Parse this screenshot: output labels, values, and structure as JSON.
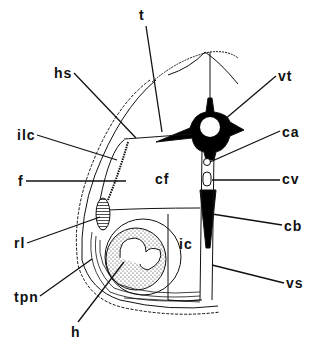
{
  "figure": {
    "type": "anatomical cross-section diagram",
    "labels": [
      {
        "id": "t",
        "text": "t",
        "x": 139,
        "y": 6
      },
      {
        "id": "hs",
        "text": "hs",
        "x": 54,
        "y": 67
      },
      {
        "id": "vt",
        "text": "vt",
        "x": 278,
        "y": 70
      },
      {
        "id": "ilc",
        "text": "ilc",
        "x": 18,
        "y": 129
      },
      {
        "id": "ca",
        "text": "ca",
        "x": 282,
        "y": 126
      },
      {
        "id": "f",
        "text": "f",
        "x": 18,
        "y": 175
      },
      {
        "id": "cf",
        "text": "cf",
        "x": 155,
        "y": 173
      },
      {
        "id": "cv",
        "text": "cv",
        "x": 282,
        "y": 173
      },
      {
        "id": "rl",
        "text": "rl",
        "x": 14,
        "y": 236
      },
      {
        "id": "ic",
        "text": "ic",
        "x": 179,
        "y": 238
      },
      {
        "id": "cb",
        "text": "cb",
        "x": 284,
        "y": 219
      },
      {
        "id": "tpn",
        "text": "tpn",
        "x": 14,
        "y": 290
      },
      {
        "id": "vs",
        "text": "vs",
        "x": 286,
        "y": 276
      },
      {
        "id": "h",
        "text": "h",
        "x": 71,
        "y": 326
      }
    ]
  },
  "colors": {
    "line": "#111111",
    "fill_dark": "#000000",
    "background": "#ffffff"
  }
}
